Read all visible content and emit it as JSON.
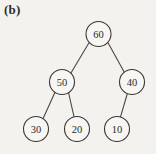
{
  "figure": {
    "panel_label": "(b)",
    "type": "binary-tree-diagram",
    "background_color": "#f4f2ee",
    "node_fill_color": "#f7f6f3",
    "node_stroke_color": "#3b3937",
    "edge_color": "#4a4846"
  },
  "tree": {
    "nodes": [
      {
        "id": "n60",
        "label": "60",
        "cx": 98.5,
        "cy": 34.0,
        "r": 12.5,
        "level": 0
      },
      {
        "id": "n50",
        "label": "50",
        "cx": 62.0,
        "cy": 82.0,
        "r": 12.5,
        "level": 1
      },
      {
        "id": "n40",
        "label": "40",
        "cx": 132.0,
        "cy": 82.0,
        "r": 12.5,
        "level": 1
      },
      {
        "id": "n30",
        "label": "30",
        "cx": 36.0,
        "cy": 129.0,
        "r": 12.5,
        "level": 2
      },
      {
        "id": "n20",
        "label": "20",
        "cx": 77.0,
        "cy": 129.0,
        "r": 12.5,
        "level": 2
      },
      {
        "id": "n10",
        "label": "10",
        "cx": 117.0,
        "cy": 129.0,
        "r": 12.5,
        "level": 2
      }
    ],
    "edges": [
      {
        "id": "e60-50",
        "from": "n60",
        "to": "n50",
        "x1": 89.0,
        "y1": 42.8,
        "x2": 70.8,
        "y2": 73.3
      },
      {
        "id": "e60-40",
        "from": "n60",
        "to": "n40",
        "x1": 108.0,
        "y1": 42.8,
        "x2": 124.6,
        "y2": 72.8
      },
      {
        "id": "e50-30",
        "from": "n50",
        "to": "n30",
        "x1": 55.0,
        "y1": 92.3,
        "x2": 43.0,
        "y2": 118.8
      },
      {
        "id": "e50-20",
        "from": "n50",
        "to": "n20",
        "x1": 68.5,
        "y1": 92.5,
        "x2": 74.0,
        "y2": 116.6
      },
      {
        "id": "e40-10",
        "from": "n40",
        "to": "n10",
        "x1": 127.5,
        "y1": 93.0,
        "x2": 120.5,
        "y2": 116.8
      }
    ]
  }
}
